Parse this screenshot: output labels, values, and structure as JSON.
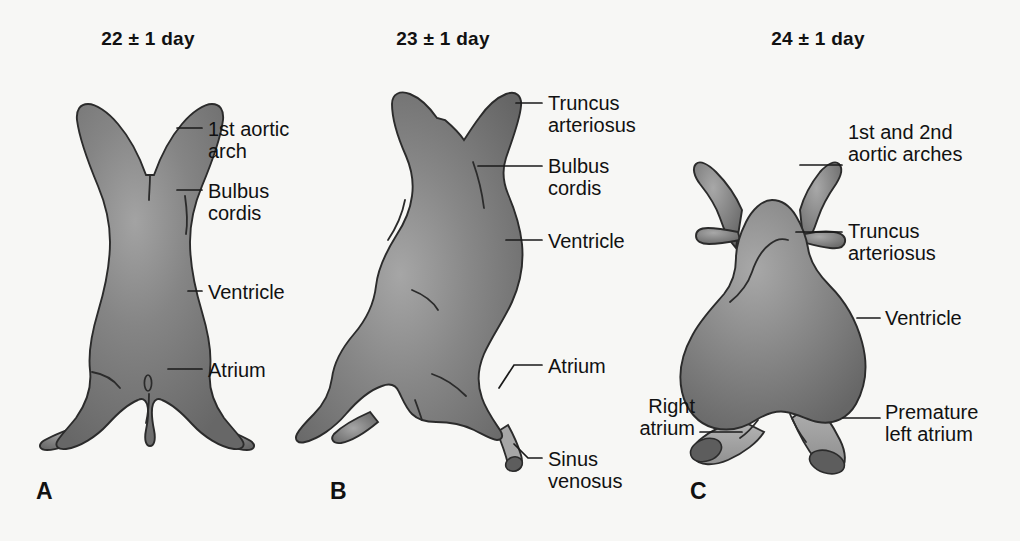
{
  "figure": {
    "background_color": "#f7f7f5",
    "text_color": "#111111",
    "organ_fill_dark": "#6f6f6f",
    "organ_fill_light": "#9a9a9a",
    "organ_outline": "#2b2b2b",
    "atrium_tube_fill": "#a6a6a6",
    "atrium_opening_fill": "#5d5d5d"
  },
  "panels": [
    {
      "letter": "A",
      "title": "22 ± 1 day",
      "title_cx": 148,
      "title_y": 28,
      "letter_x": 36,
      "letter_y": 478,
      "labels": [
        {
          "text": "1st aortic\narch",
          "x": 208,
          "y": 118
        },
        {
          "text": "Bulbus\ncordis",
          "x": 208,
          "y": 180
        },
        {
          "text": "Ventricle",
          "x": 208,
          "y": 285
        },
        {
          "text": "Atrium",
          "x": 208,
          "y": 362
        }
      ]
    },
    {
      "letter": "B",
      "title": "23 ± 1 day",
      "title_cx": 443,
      "title_y": 28,
      "letter_x": 330,
      "letter_y": 478,
      "labels": [
        {
          "text": "Truncus\narteriosus",
          "x": 548,
          "y": 94
        },
        {
          "text": "Bulbus\ncordis",
          "x": 548,
          "y": 158
        },
        {
          "text": "Ventricle",
          "x": 548,
          "y": 231
        },
        {
          "text": "Atrium",
          "x": 548,
          "y": 358
        },
        {
          "text": "Sinus\nvenosus",
          "x": 548,
          "y": 455
        }
      ]
    },
    {
      "letter": "C",
      "title": "24 ± 1 day",
      "title_cx": 818,
      "title_y": 28,
      "letter_x": 690,
      "letter_y": 478,
      "labels": [
        {
          "text": "1st and 2nd\naortic arches",
          "x": 848,
          "y": 124,
          "align": "left"
        },
        {
          "text": "Truncus\narteriosus",
          "x": 848,
          "y": 222,
          "align": "left"
        },
        {
          "text": "Ventricle",
          "x": 885,
          "y": 309,
          "align": "left"
        },
        {
          "text": "Right\natrium",
          "x": 695,
          "y": 397,
          "align": "right"
        },
        {
          "text": "Premature\nleft atrium",
          "x": 885,
          "y": 403,
          "align": "left"
        }
      ]
    }
  ]
}
